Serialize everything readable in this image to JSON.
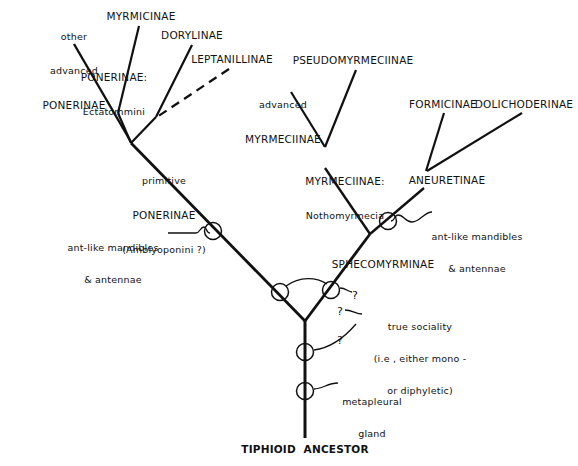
{
  "figure": {
    "type": "cladogram",
    "background_color": "#ffffff",
    "line_color": "#111111"
  },
  "taxa": [
    {
      "id": "other-advanced-ponerinae",
      "line1": "other",
      "line2": "advanced",
      "line3": "PONERINAE",
      "x": 74,
      "y": 12
    },
    {
      "id": "myrmicinae",
      "label": "MYRMICINAE",
      "x": 136,
      "y": 14
    },
    {
      "id": "ponerinae-ectatommini",
      "line1": "PONERINAE:",
      "line2": "Ectatommini",
      "x": 111,
      "y": 50
    },
    {
      "id": "dorylinae",
      "label": "DORYLINAE",
      "x": 190,
      "y": 33
    },
    {
      "id": "leptanillinae",
      "label": "LEPTANILLINAE",
      "x": 230,
      "y": 57
    },
    {
      "id": "pseudomyrmeciinae",
      "label": "PSEUDOMYRMECIINAE",
      "x": 351,
      "y": 58
    },
    {
      "id": "advanced-myrmeciinae",
      "line1": "advanced",
      "line2": "MYRMECIINAE",
      "x": 278,
      "y": 80
    },
    {
      "id": "formicinae",
      "label": "FORMICINAE",
      "x": 441,
      "y": 102
    },
    {
      "id": "dolichoderinae",
      "label": "DOLICHODERINAE",
      "x": 526,
      "y": 102
    },
    {
      "id": "primitive-ponerinae",
      "line1": "primitive",
      "line2": "PONERINAE",
      "line3": "(Amblyoponini ?)",
      "x": 163,
      "y": 156
    },
    {
      "id": "myrmeciinae-nothomyrmecia",
      "line1": "MYRMECIINAE:",
      "line2": "Nothomyrmecia",
      "x": 343,
      "y": 155
    },
    {
      "id": "aneuretinae",
      "label": "ANEURETINAE",
      "x": 445,
      "y": 178
    },
    {
      "id": "sphecomyrminae",
      "label": "SPHECOMYRMINAE",
      "x": 381,
      "y": 263
    },
    {
      "id": "tiphioid-ancestor",
      "label": "TIPHIOID  ANCESTOR",
      "x": 305,
      "y": 448
    }
  ],
  "annotations": [
    {
      "id": "ant-like-left",
      "line1": "ant-like mandibles",
      "line2": "& antennae",
      "x": 140,
      "y": 226
    },
    {
      "id": "ant-like-right",
      "line1": "ant-like mandibles",
      "line2": "& antennae",
      "x": 472,
      "y": 215
    },
    {
      "id": "true-sociality",
      "line1": "true sociality",
      "line2": "(i.e , either mono -",
      "line3": "or diphyletic)",
      "x": 418,
      "y": 305
    },
    {
      "id": "metapleural-gland",
      "line1": "metapleural",
      "line2": "gland",
      "x": 366,
      "y": 380
    }
  ],
  "question_marks": [
    {
      "id": "q-upper-right",
      "label": "?",
      "x": 354,
      "y": 297
    },
    {
      "id": "q-mid",
      "label": "?",
      "x": 339,
      "y": 312
    },
    {
      "id": "q-lower",
      "label": "?",
      "x": 339,
      "y": 341
    }
  ],
  "character_nodes": [
    {
      "id": "node-left-antlike",
      "cx": 213,
      "cy": 232,
      "r": 8,
      "character": "ant-like mandibles & antennae"
    },
    {
      "id": "node-right-antlike",
      "cx": 388,
      "cy": 222,
      "r": 8,
      "character": "ant-like mandibles & antennae"
    },
    {
      "id": "node-sociality-left",
      "cx": 280,
      "cy": 292,
      "r": 8,
      "character": "true sociality"
    },
    {
      "id": "node-sociality-right",
      "cx": 330,
      "cy": 290,
      "r": 8,
      "character": "true sociality"
    },
    {
      "id": "node-sociality-stem",
      "cx": 305,
      "cy": 352,
      "r": 8,
      "character": "true sociality"
    },
    {
      "id": "node-metapleural",
      "cx": 305,
      "cy": 391,
      "r": 8,
      "character": "metapleural gland"
    }
  ],
  "branches": [
    {
      "id": "branch-other-advanced-ponerinae",
      "style": "solid",
      "from": [
        74,
        44
      ],
      "to": [
        130,
        142
      ]
    },
    {
      "id": "branch-myrmicinae",
      "style": "solid",
      "from": [
        139,
        26
      ],
      "to": [
        118,
        112
      ]
    },
    {
      "id": "branch-ponerinae-ectatommini",
      "style": "solid",
      "from": [
        118,
        112
      ],
      "to": [
        130,
        142
      ]
    },
    {
      "id": "branch-dorylinae",
      "style": "solid",
      "from": [
        191,
        45
      ],
      "to": [
        155,
        116
      ]
    },
    {
      "id": "branch-leptanillinae",
      "style": "dashed",
      "from": [
        228,
        70
      ],
      "to": [
        155,
        116
      ]
    },
    {
      "id": "branch-dorylinae-stem",
      "style": "solid",
      "from": [
        155,
        116
      ],
      "to": [
        130,
        142
      ]
    },
    {
      "id": "branch-primitive-ponerinae-stem",
      "style": "solid",
      "from": [
        130,
        142
      ],
      "to": [
        305,
        320
      ]
    },
    {
      "id": "branch-pseudomyrmeciinae",
      "style": "solid",
      "from": [
        355,
        70
      ],
      "to": [
        324,
        146
      ]
    },
    {
      "id": "branch-advanced-myrmeciinae",
      "style": "solid",
      "from": [
        290,
        92
      ],
      "to": [
        324,
        146
      ]
    },
    {
      "id": "branch-myrmeciinae-stem",
      "style": "solid",
      "from": [
        324,
        146
      ],
      "to": [
        370,
        233
      ]
    },
    {
      "id": "branch-formicinae",
      "style": "solid",
      "from": [
        443,
        113
      ],
      "to": [
        425,
        170
      ]
    },
    {
      "id": "branch-dolichoderinae",
      "style": "solid",
      "from": [
        521,
        113
      ],
      "to": [
        425,
        170
      ]
    },
    {
      "id": "branch-aneuretinae-stem",
      "style": "solid",
      "from": [
        425,
        170
      ],
      "to": [
        370,
        233
      ]
    },
    {
      "id": "branch-sphecomyrminae-stem",
      "style": "solid",
      "from": [
        370,
        233
      ],
      "to": [
        305,
        320
      ]
    },
    {
      "id": "branch-trunk",
      "style": "solid",
      "from": [
        305,
        320
      ],
      "to": [
        305,
        438
      ]
    }
  ]
}
